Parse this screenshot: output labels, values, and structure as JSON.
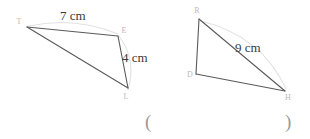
{
  "figure": {
    "background_color": "#ffffff",
    "line_color": "#5a5a5a",
    "arc_color": "#e2e2e2",
    "label_color": "#3a3a3a",
    "vertex_label_color": "#b9b9b9",
    "paren_color": "#9a9a9a"
  },
  "triangles": [
    {
      "name": "left-triangle",
      "vertices": [
        {
          "label": "T",
          "x": 27,
          "y": 27
        },
        {
          "label": "E",
          "x": 118,
          "y": 36
        },
        {
          "label": "L",
          "x": 128,
          "y": 88
        }
      ],
      "measures": [
        {
          "label": "7 cm",
          "x": 60,
          "y": 20
        },
        {
          "label": "4 cm",
          "x": 122,
          "y": 62
        }
      ]
    },
    {
      "name": "right-triangle",
      "vertices": [
        {
          "label": "R",
          "x": 199,
          "y": 19
        },
        {
          "label": "D",
          "x": 196,
          "y": 74
        },
        {
          "label": "H",
          "x": 285,
          "y": 91
        }
      ],
      "measures": [
        {
          "label": "9 cm",
          "x": 235,
          "y": 52
        }
      ]
    }
  ],
  "parentheses": {
    "left": "(",
    "right": ")"
  }
}
